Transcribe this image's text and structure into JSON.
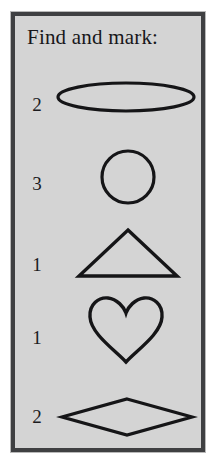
{
  "worksheet": {
    "title": "Find and mark:",
    "background_color": "#d4d4d4",
    "border_color": "#3f4042",
    "ink_color": "#151517",
    "rows": [
      {
        "count": "2",
        "shape_name": "ellipse-shape",
        "shape_label": "ellipse"
      },
      {
        "count": "3",
        "shape_name": "circle-shape",
        "shape_label": "circle"
      },
      {
        "count": "1",
        "shape_name": "triangle-shape",
        "shape_label": "triangle"
      },
      {
        "count": "1",
        "shape_name": "heart-shape",
        "shape_label": "heart"
      },
      {
        "count": "2",
        "shape_name": "rhombus-shape",
        "shape_label": "rhombus"
      }
    ]
  }
}
